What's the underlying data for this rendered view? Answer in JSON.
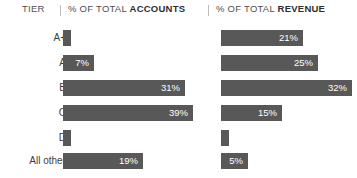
{
  "header": {
    "tier_label": "TIER",
    "accounts_prefix": "% OF TOTAL ",
    "accounts_strong": "ACCOUNTS",
    "revenue_prefix": "% OF TOTAL ",
    "revenue_strong": "REVENUE"
  },
  "colors": {
    "bar": "#585858",
    "bar_text": "#ffffff",
    "header_text": "#4f4f4f",
    "divider": "#bdbdbd",
    "background": "#ffffff"
  },
  "chart_data": {
    "type": "bar",
    "title": "",
    "xlabel": "",
    "ylabel": "TIER",
    "orientation": "horizontal",
    "grid": false,
    "legend": "none",
    "categories": [
      "A+",
      "A",
      "B",
      "C",
      "D",
      "All other"
    ],
    "series": [
      {
        "name": "% OF TOTAL ACCOUNTS",
        "values": [
          1.5,
          7,
          31,
          39,
          1.5,
          19
        ],
        "labels": [
          "",
          "7%",
          "31%",
          "39%",
          "",
          "19%"
        ]
      },
      {
        "name": "% OF TOTAL REVENUE",
        "values": [
          21,
          25,
          32,
          15,
          2,
          5
        ],
        "labels": [
          "21%",
          "25%",
          "32%",
          "15%",
          "",
          "5%"
        ]
      }
    ],
    "xlim": [
      0,
      40
    ]
  },
  "rows": [
    {
      "tier": "A+",
      "accounts": {
        "value": 1.5,
        "label": "",
        "width_px": 8
      },
      "revenue": {
        "value": 21,
        "label": "21%",
        "width_px": 82
      }
    },
    {
      "tier": "A",
      "accounts": {
        "value": 7,
        "label": "7%",
        "width_px": 31
      },
      "revenue": {
        "value": 25,
        "label": "25%",
        "width_px": 97
      }
    },
    {
      "tier": "B",
      "accounts": {
        "value": 31,
        "label": "31%",
        "width_px": 122
      },
      "revenue": {
        "value": 32,
        "label": "32%",
        "width_px": 131
      }
    },
    {
      "tier": "C",
      "accounts": {
        "value": 39,
        "label": "39%",
        "width_px": 130
      },
      "revenue": {
        "value": 15,
        "label": "15%",
        "width_px": 61
      }
    },
    {
      "tier": "D",
      "accounts": {
        "value": 1.5,
        "label": "",
        "width_px": 8
      },
      "revenue": {
        "value": 2,
        "label": "",
        "width_px": 8
      }
    },
    {
      "tier": "All other",
      "accounts": {
        "value": 19,
        "label": "19%",
        "width_px": 80
      },
      "revenue": {
        "value": 5,
        "label": "5%",
        "width_px": 27
      }
    }
  ],
  "layout": {
    "row_tops": [
      30,
      55,
      80,
      105,
      130,
      153
    ],
    "acc_left": 63,
    "rev_left": 221,
    "bar_height": 16
  }
}
